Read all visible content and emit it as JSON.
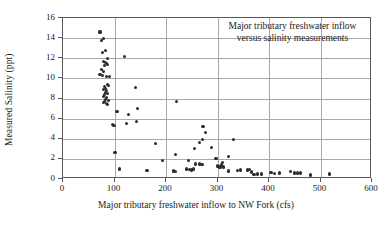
{
  "chart_data": {
    "type": "scatter",
    "title": "",
    "annotation": [
      "Major tributary freshwater inflow",
      "versus salinity measurements"
    ],
    "xlabel": "Major tributary freshwater inflow to NW Fork (cfs)",
    "ylabel": "Measured Salinity (ppt)",
    "xlim": [
      0,
      600
    ],
    "ylim": [
      0,
      16
    ],
    "xticks": [
      0,
      100,
      200,
      300,
      400,
      500,
      600
    ],
    "yticks": [
      0,
      2,
      4,
      6,
      8,
      10,
      12,
      14,
      16
    ],
    "grid": "horizontal-and-vertical",
    "legend": "none",
    "marker_color": "#2c2c2e",
    "axis_color": "#58585a",
    "grid_color": "#a8a8aa",
    "series": [
      {
        "name": "Measured salinity",
        "points": [
          [
            72,
            14.6
          ],
          [
            74,
            13.8
          ],
          [
            78,
            14.0
          ],
          [
            76,
            12.6
          ],
          [
            83,
            12.8
          ],
          [
            86,
            12.0
          ],
          [
            120,
            12.2
          ],
          [
            79,
            11.7
          ],
          [
            82,
            11.6
          ],
          [
            84,
            11.5
          ],
          [
            80,
            11.3
          ],
          [
            87,
            11.4
          ],
          [
            74,
            10.9
          ],
          [
            78,
            10.7
          ],
          [
            72,
            10.4
          ],
          [
            76,
            10.3
          ],
          [
            85,
            10.2
          ],
          [
            90,
            10.2
          ],
          [
            86,
            9.4
          ],
          [
            88,
            9.3
          ],
          [
            81,
            9.2
          ],
          [
            83,
            9.0
          ],
          [
            140,
            9.1
          ],
          [
            79,
            8.9
          ],
          [
            84,
            8.8
          ],
          [
            82,
            8.6
          ],
          [
            86,
            8.5
          ],
          [
            80,
            8.4
          ],
          [
            78,
            8.2
          ],
          [
            85,
            8.1
          ],
          [
            83,
            7.9
          ],
          [
            88,
            7.8
          ],
          [
            81,
            7.7
          ],
          [
            79,
            7.6
          ],
          [
            84,
            7.5
          ],
          [
            86,
            7.4
          ],
          [
            220,
            7.7
          ],
          [
            105,
            6.7
          ],
          [
            127,
            6.4
          ],
          [
            144,
            7.0
          ],
          [
            124,
            5.5
          ],
          [
            143,
            5.7
          ],
          [
            96,
            5.4
          ],
          [
            99,
            5.3
          ],
          [
            272,
            5.2
          ],
          [
            277,
            4.6
          ],
          [
            331,
            3.9
          ],
          [
            271,
            3.9
          ],
          [
            180,
            3.5
          ],
          [
            265,
            3.6
          ],
          [
            255,
            3.0
          ],
          [
            289,
            3.1
          ],
          [
            219,
            2.4
          ],
          [
            101,
            2.6
          ],
          [
            322,
            2.2
          ],
          [
            297,
            2.0
          ],
          [
            244,
            1.8
          ],
          [
            193,
            1.8
          ],
          [
            258,
            1.5
          ],
          [
            265,
            1.5
          ],
          [
            270,
            1.45
          ],
          [
            300,
            1.3
          ],
          [
            303,
            1.25
          ],
          [
            307,
            1.4
          ],
          [
            309,
            1.6
          ],
          [
            312,
            1.2
          ],
          [
            305,
            1.15
          ],
          [
            240,
            1.0
          ],
          [
            245,
            0.95
          ],
          [
            249,
            0.9
          ],
          [
            253,
            1.0
          ],
          [
            214,
            0.8
          ],
          [
            218,
            0.75
          ],
          [
            110,
            1.0
          ],
          [
            163,
            0.85
          ],
          [
            322,
            0.8
          ],
          [
            339,
            0.85
          ],
          [
            345,
            0.9
          ],
          [
            358,
            0.9
          ],
          [
            362,
            0.95
          ],
          [
            366,
            0.7
          ],
          [
            371,
            0.45
          ],
          [
            378,
            0.5
          ],
          [
            385,
            0.5
          ],
          [
            404,
            0.65
          ],
          [
            411,
            0.55
          ],
          [
            420,
            0.6
          ],
          [
            441,
            0.75
          ],
          [
            449,
            0.6
          ],
          [
            455,
            0.6
          ],
          [
            461,
            0.6
          ],
          [
            481,
            0.4
          ],
          [
            517,
            0.5
          ]
        ]
      }
    ]
  }
}
